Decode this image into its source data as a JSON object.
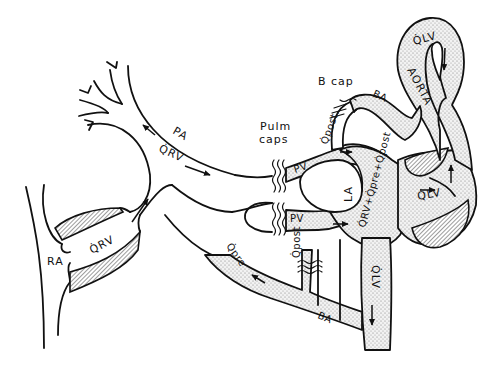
{
  "diagram": {
    "style": "black-and-white line art",
    "colors": {
      "ink": "#111111",
      "background": "#ffffff",
      "stipple": "#9a9a9a"
    },
    "labels": {
      "pa": "PA",
      "qrv_upper": "Q̇RV",
      "qrv_lower": "Q̇RV",
      "ra": "RA",
      "pulm_caps_line1": "Pulm",
      "pulm_caps_line2": "caps",
      "pv_upper": "PV",
      "pv_lower": "PV",
      "b_cap": "B cap",
      "ba_upper": "BA",
      "ba_lower": "BA",
      "qpost_upper": "Q̇post.",
      "qpost_lower": "Q̇post",
      "la": "LA",
      "la_sum": "Q̇RV+Q̇pre+Q̇post",
      "qlv_ventricle": "Q̇LV",
      "qlv_aorta_top": "Q̇LV",
      "qlv_descending": "Q̇LV",
      "aorta": "AORTA",
      "qpre": "Q̇pre"
    },
    "nodes": [
      {
        "id": "RA",
        "name": "Right atrium"
      },
      {
        "id": "RV",
        "name": "Right ventricle"
      },
      {
        "id": "PA",
        "name": "Pulmonary artery"
      },
      {
        "id": "Pulm caps",
        "name": "Pulmonary capillaries"
      },
      {
        "id": "PV",
        "name": "Pulmonary veins"
      },
      {
        "id": "LA",
        "name": "Left atrium"
      },
      {
        "id": "LV",
        "name": "Left ventricle"
      },
      {
        "id": "AORTA",
        "name": "Aorta"
      },
      {
        "id": "BA",
        "name": "Bronchial arteries"
      },
      {
        "id": "B cap",
        "name": "Bronchial capillaries"
      }
    ],
    "edges": [
      {
        "from": "RA",
        "to": "RV"
      },
      {
        "from": "RV",
        "to": "PA",
        "flow": "Q̇RV"
      },
      {
        "from": "PA",
        "to": "Pulm caps"
      },
      {
        "from": "Pulm caps",
        "to": "PV"
      },
      {
        "from": "PV",
        "to": "LA"
      },
      {
        "from": "LA",
        "to": "LV",
        "flow": "Q̇RV+Q̇pre+Q̇post"
      },
      {
        "from": "LV",
        "to": "AORTA",
        "flow": "Q̇LV"
      },
      {
        "from": "AORTA",
        "to": "BA"
      },
      {
        "from": "BA",
        "to": "B cap",
        "flow": "Q̇post"
      },
      {
        "from": "B cap",
        "to": "PV",
        "flow": "Q̇post"
      },
      {
        "from": "BA",
        "to": "PA",
        "flow": "Q̇pre"
      }
    ]
  }
}
